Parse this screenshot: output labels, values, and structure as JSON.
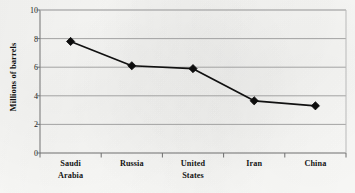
{
  "chart_data": {
    "type": "line",
    "title": "",
    "subtitle": "",
    "xlabel": "",
    "ylabel": "Millions of barrels",
    "categories": [
      "Saudi Arabia",
      "Russia",
      "United States",
      "Iran",
      "China"
    ],
    "category_lines": [
      [
        "Saudi",
        "Arabia"
      ],
      [
        "Russia"
      ],
      [
        "United",
        "States"
      ],
      [
        "Iran"
      ],
      [
        "China"
      ]
    ],
    "values": [
      7.8,
      6.1,
      5.9,
      3.65,
      3.3
    ],
    "series": [
      {
        "name": "Oil production",
        "values": [
          7.8,
          6.1,
          5.9,
          3.65,
          3.3
        ]
      }
    ],
    "ylim": [
      0,
      10
    ],
    "yticks": [
      0,
      2,
      4,
      6,
      8,
      10
    ],
    "ytick_labels": [
      "0",
      "2",
      "4",
      "6",
      "8",
      "10"
    ],
    "grid": "horizontal",
    "legend": "none",
    "marker": "diamond",
    "colors": {
      "line": "#111111",
      "marker": "#0d0d0d",
      "grid": "#9a9a9a",
      "axis": "#6e6e6e",
      "background": "#fbfbf9",
      "text": "#141414"
    }
  }
}
